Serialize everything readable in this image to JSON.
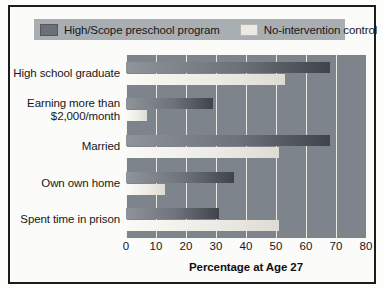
{
  "chart_data": {
    "type": "bar",
    "orientation": "horizontal",
    "title": "",
    "xlabel": "Percentage at Age 27",
    "ylabel": "",
    "xlim": [
      0,
      80
    ],
    "xticks": [
      0,
      10,
      20,
      30,
      40,
      50,
      60,
      70,
      80
    ],
    "grid": true,
    "legend_position": "top",
    "categories": [
      "High school graduate",
      "Earning more than $2,000/month",
      "Married",
      "Own own home",
      "Spent time in prison"
    ],
    "series": [
      {
        "name": "High/Scope preschool program",
        "color": "#6b7078",
        "values": [
          68,
          29,
          68,
          36,
          31
        ]
      },
      {
        "name": "No-intervention control",
        "color": "#eceae4",
        "values": [
          53,
          7,
          51,
          13,
          51
        ]
      }
    ]
  },
  "legend": {
    "entries": [
      {
        "label": "High/Scope preschool program",
        "swatch": "dark-swatch-icon"
      },
      {
        "label": "No-intervention control",
        "swatch": "light-swatch-icon"
      }
    ]
  },
  "axis": {
    "x_title": "Percentage at Age 27",
    "tick_labels": [
      "0",
      "10",
      "20",
      "30",
      "40",
      "50",
      "60",
      "70",
      "80"
    ]
  },
  "category_labels": [
    {
      "line1": "High school graduate",
      "line2": ""
    },
    {
      "line1": "Earning more than",
      "line2": "$2,000/month"
    },
    {
      "line1": "Married",
      "line2": ""
    },
    {
      "line1": "Own own home",
      "line2": ""
    },
    {
      "line1": "Spent time in prison",
      "line2": ""
    }
  ]
}
